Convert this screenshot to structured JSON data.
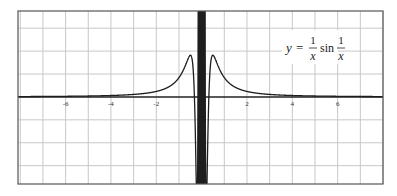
{
  "chart_data": {
    "type": "line",
    "title": "",
    "xlabel": "",
    "ylabel": "",
    "xlim": [
      -8.1,
      8.0
    ],
    "ylim": [
      -3.8,
      3.75
    ],
    "grid": true,
    "x_ticks": [
      -6,
      -4,
      -2,
      2,
      4,
      6
    ],
    "x_tick_labels": [
      "-6",
      "-4",
      "-2",
      "2",
      "4",
      "6"
    ],
    "series": [
      {
        "name": "y = (1/x) sin(1/x)",
        "function": "(1/x)*sin(1/x)",
        "color": "#1e1e1e"
      }
    ],
    "annotation": {
      "lhs": "y",
      "equals": "=",
      "frac1_num": "1",
      "frac1_den": "x",
      "func": "sin",
      "frac2_num": "1",
      "frac2_den": "x",
      "position": "top-right"
    }
  }
}
